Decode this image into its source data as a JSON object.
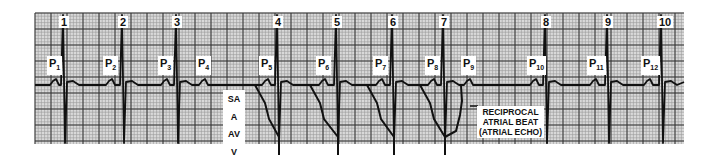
{
  "figure": {
    "type": "ecg_rhythm_strip_with_ladder_diagram",
    "grid": {
      "x0": 35,
      "y0": 13,
      "x1": 684,
      "y1": 144,
      "small": 3.2,
      "large": 16,
      "minor_color": "#9a9a9a",
      "major_color": "#333333",
      "bg": "#d9d9d9"
    },
    "baseline_y": 85,
    "beats": [
      {
        "label": "1",
        "x": 63
      },
      {
        "label": "2",
        "x": 122
      },
      {
        "label": "3",
        "x": 176
      },
      {
        "label": "4",
        "x": 277
      },
      {
        "label": "5",
        "x": 336
      },
      {
        "label": "6",
        "x": 392
      },
      {
        "label": "7",
        "x": 443
      },
      {
        "label": "8",
        "x": 545
      },
      {
        "label": "9",
        "x": 607
      },
      {
        "label": "10",
        "x": 661
      }
    ],
    "p_waves": [
      {
        "label": "P",
        "sub": "1",
        "x": 47
      },
      {
        "label": "P",
        "sub": "2",
        "x": 103
      },
      {
        "label": "P",
        "sub": "3",
        "x": 158
      },
      {
        "label": "P",
        "sub": "4",
        "x": 196
      },
      {
        "label": "P",
        "sub": "5",
        "x": 259
      },
      {
        "label": "P",
        "sub": "6",
        "x": 316
      },
      {
        "label": "P",
        "sub": "7",
        "x": 373
      },
      {
        "label": "P",
        "sub": "8",
        "x": 425
      },
      {
        "label": "P",
        "sub": "9",
        "x": 461
      },
      {
        "label": "P",
        "sub": "10",
        "x": 527
      },
      {
        "label": "P",
        "sub": "11",
        "x": 587
      },
      {
        "label": "P",
        "sub": "12",
        "x": 641
      }
    ],
    "ladder": {
      "levels": [
        "SA",
        "A",
        "AV",
        "V"
      ],
      "annotation": [
        "RECIPROCAL",
        "ATRIAL BEAT",
        "(ATRIAL ECHO)"
      ]
    }
  }
}
